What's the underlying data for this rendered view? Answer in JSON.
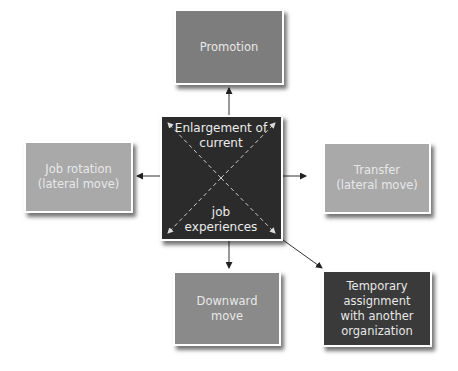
{
  "diagram": {
    "center": {
      "top_label": "Enlargement of\ncurrent",
      "bottom_label": "job\nexperiences"
    },
    "nodes": [
      {
        "id": "promotion",
        "label": "Promotion",
        "position": "top"
      },
      {
        "id": "job-rotation",
        "label": "Job rotation\n(lateral move)",
        "position": "left"
      },
      {
        "id": "transfer",
        "label": "Transfer\n(lateral move)",
        "position": "right"
      },
      {
        "id": "downward-move",
        "label": "Downward\nmove",
        "position": "bottom"
      },
      {
        "id": "temporary-assignment",
        "label": "Temporary\nassignment\nwith another\norganization",
        "position": "bottom-right"
      }
    ],
    "colors": {
      "center": "#2b2b2b",
      "promotion": "#7d7d7d",
      "lateral": "#a9a9a9",
      "downward": "#8a8a8a",
      "temporary": "#3a3a3a"
    }
  }
}
